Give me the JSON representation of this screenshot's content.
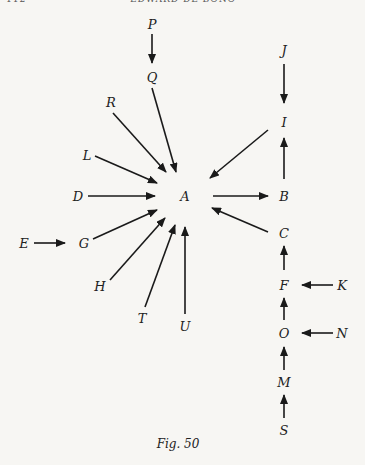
{
  "header": {
    "page_number": "112",
    "running_title": "EDWARD DE BONO"
  },
  "caption": "Fig. 50",
  "nodes": [
    {
      "id": "P",
      "x": 152,
      "y": 24
    },
    {
      "id": "Q",
      "x": 152,
      "y": 77
    },
    {
      "id": "R",
      "x": 111,
      "y": 102
    },
    {
      "id": "L",
      "x": 87,
      "y": 155
    },
    {
      "id": "D",
      "x": 78,
      "y": 196
    },
    {
      "id": "A",
      "x": 185,
      "y": 196
    },
    {
      "id": "E",
      "x": 24,
      "y": 243
    },
    {
      "id": "G",
      "x": 84,
      "y": 243
    },
    {
      "id": "H",
      "x": 100,
      "y": 286
    },
    {
      "id": "T",
      "x": 142,
      "y": 318
    },
    {
      "id": "U",
      "x": 185,
      "y": 326
    },
    {
      "id": "J",
      "x": 284,
      "y": 50
    },
    {
      "id": "I",
      "x": 284,
      "y": 122
    },
    {
      "id": "B",
      "x": 284,
      "y": 196
    },
    {
      "id": "C",
      "x": 284,
      "y": 233
    },
    {
      "id": "F",
      "x": 284,
      "y": 285
    },
    {
      "id": "K",
      "x": 342,
      "y": 285
    },
    {
      "id": "O",
      "x": 284,
      "y": 333
    },
    {
      "id": "N",
      "x": 342,
      "y": 333
    },
    {
      "id": "M",
      "x": 284,
      "y": 382
    },
    {
      "id": "S",
      "x": 284,
      "y": 430
    }
  ],
  "edges": [
    {
      "from": "P",
      "to": "Q",
      "x1": 152,
      "y1": 34,
      "x2": 152,
      "y2": 63
    },
    {
      "from": "Q",
      "to": "A",
      "x1": 152,
      "y1": 88,
      "x2": 176,
      "y2": 172
    },
    {
      "from": "R",
      "to": "A",
      "x1": 113,
      "y1": 113,
      "x2": 166,
      "y2": 172
    },
    {
      "from": "L",
      "to": "A",
      "x1": 95,
      "y1": 156,
      "x2": 157,
      "y2": 183
    },
    {
      "from": "D",
      "to": "A",
      "x1": 88,
      "y1": 196,
      "x2": 155,
      "y2": 196
    },
    {
      "from": "G",
      "to": "A",
      "x1": 93,
      "y1": 239,
      "x2": 157,
      "y2": 210
    },
    {
      "from": "H",
      "to": "A",
      "x1": 110,
      "y1": 280,
      "x2": 165,
      "y2": 218
    },
    {
      "from": "T",
      "to": "A",
      "x1": 145,
      "y1": 307,
      "x2": 175,
      "y2": 225
    },
    {
      "from": "U",
      "to": "A",
      "x1": 185,
      "y1": 314,
      "x2": 185,
      "y2": 227
    },
    {
      "from": "E",
      "to": "G",
      "x1": 34,
      "y1": 243,
      "x2": 65,
      "y2": 243
    },
    {
      "from": "J",
      "to": "I",
      "x1": 284,
      "y1": 64,
      "x2": 284,
      "y2": 103
    },
    {
      "from": "I",
      "to": "A",
      "x1": 268,
      "y1": 130,
      "x2": 210,
      "y2": 178
    },
    {
      "from": "B",
      "to": "I",
      "x1": 284,
      "y1": 179,
      "x2": 284,
      "y2": 138
    },
    {
      "from": "A",
      "to": "B",
      "x1": 213,
      "y1": 196,
      "x2": 268,
      "y2": 196
    },
    {
      "from": "C",
      "to": "A",
      "x1": 268,
      "y1": 232,
      "x2": 212,
      "y2": 208
    },
    {
      "from": "F",
      "to": "C",
      "x1": 284,
      "y1": 270,
      "x2": 284,
      "y2": 246
    },
    {
      "from": "K",
      "to": "F",
      "x1": 333,
      "y1": 285,
      "x2": 302,
      "y2": 285
    },
    {
      "from": "O",
      "to": "F",
      "x1": 284,
      "y1": 320,
      "x2": 284,
      "y2": 298
    },
    {
      "from": "N",
      "to": "O",
      "x1": 333,
      "y1": 333,
      "x2": 302,
      "y2": 333
    },
    {
      "from": "M",
      "to": "O",
      "x1": 284,
      "y1": 370,
      "x2": 284,
      "y2": 347
    },
    {
      "from": "S",
      "to": "M",
      "x1": 284,
      "y1": 418,
      "x2": 284,
      "y2": 395
    }
  ]
}
